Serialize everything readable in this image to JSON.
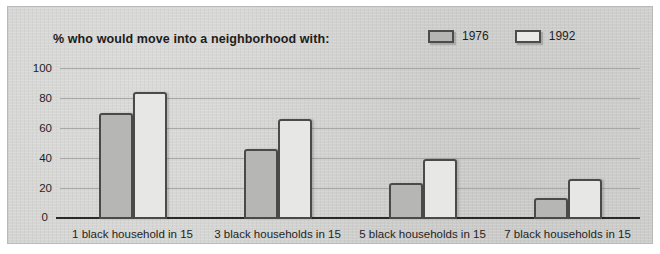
{
  "chart_data": {
    "type": "bar",
    "title": "% who would move into a neighborhood with:",
    "xlabel": "",
    "ylabel": "",
    "ylim": [
      0,
      100
    ],
    "yticks": [
      0,
      20,
      40,
      60,
      80,
      100
    ],
    "grid": true,
    "legend_position": "top-right",
    "categories": [
      "1 black household in 15",
      "3 black households in 15",
      "5 black households in 15",
      "7 black households in 15"
    ],
    "series": [
      {
        "name": "1976",
        "values": [
          71,
          47,
          24,
          14
        ],
        "color": "#b6b6b4"
      },
      {
        "name": "1992",
        "values": [
          85,
          67,
          40,
          27
        ],
        "color": "#e7e7e5"
      }
    ]
  },
  "legend": {
    "items": [
      {
        "label": "1976",
        "swatch": "filled"
      },
      {
        "label": "1992",
        "swatch": "hollow"
      }
    ]
  }
}
